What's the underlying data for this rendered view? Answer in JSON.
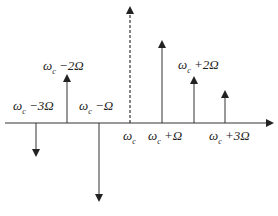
{
  "diagram": {
    "axis": {
      "y": 123,
      "x_start": 5,
      "x_end": 272
    },
    "carrier_line": {
      "x": 130,
      "top": 8,
      "style": "dashed"
    },
    "lines": [
      {
        "x": 36,
        "tip": 155,
        "direction": "down"
      },
      {
        "x": 67,
        "tip": 76,
        "direction": "up"
      },
      {
        "x": 99,
        "tip": 200,
        "direction": "down"
      },
      {
        "x": 162,
        "tip": 42,
        "direction": "up"
      },
      {
        "x": 194,
        "tip": 78,
        "direction": "up"
      },
      {
        "x": 225,
        "tip": 92,
        "direction": "up"
      }
    ],
    "labels": {
      "m3": {
        "base": "ω",
        "sub": "c",
        "rest": " −3Ω"
      },
      "m2": {
        "base": "ω",
        "sub": "c",
        "rest": " −2Ω"
      },
      "m1": {
        "base": "ω",
        "sub": "c",
        "rest": " −Ω"
      },
      "c": {
        "base": "ω",
        "sub": "c",
        "rest": ""
      },
      "p1": {
        "base": "ω",
        "sub": "c",
        "rest": " +Ω"
      },
      "p2": {
        "base": "ω",
        "sub": "c",
        "rest": " +2Ω"
      },
      "p3": {
        "base": "ω",
        "sub": "c",
        "rest": " +3Ω"
      }
    },
    "color": "#222222"
  }
}
